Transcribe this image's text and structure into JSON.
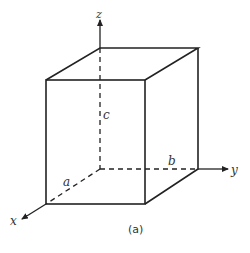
{
  "diagram": {
    "type": "rectangular-box-with-axes",
    "axes": {
      "x": "x",
      "y": "y",
      "z": "z"
    },
    "edge_labels": {
      "a": "a",
      "b": "b",
      "c": "c"
    },
    "caption": "(a)",
    "colors": {
      "line": "#222222",
      "background": "#ffffff"
    }
  }
}
